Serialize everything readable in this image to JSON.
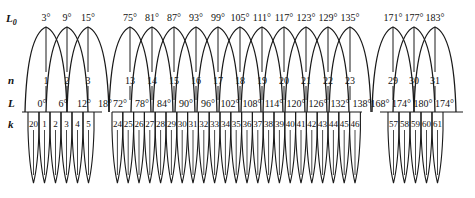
{
  "diagram": {
    "row_labels": {
      "L0": "L",
      "L0_sub": "0",
      "n": "n",
      "L": "L",
      "k": "k"
    },
    "colors": {
      "stroke": "#1a1a1a",
      "background": "#ffffff"
    },
    "groups": [
      {
        "n": [
          "1",
          "2",
          "3"
        ],
        "L0": [
          "3°",
          "9°",
          "15°"
        ],
        "L": [
          "0°",
          "6°",
          "12°",
          "18°"
        ],
        "k": [
          "20",
          "1",
          "2",
          "3",
          "4",
          "5"
        ]
      },
      {
        "n": [
          "13",
          "14",
          "15",
          "16",
          "17",
          "18",
          "19",
          "20",
          "21",
          "22",
          "23"
        ],
        "L0": [
          "75°",
          "81°",
          "87°",
          "93°",
          "99°",
          "105°",
          "111°",
          "117°",
          "123°",
          "129°",
          "135°"
        ],
        "L": [
          "72°",
          "78°",
          "84°",
          "90°",
          "96°",
          "102°",
          "108°",
          "114°",
          "120°",
          "126°",
          "132°",
          "138°"
        ],
        "k": [
          "24",
          "25",
          "26",
          "27",
          "28",
          "29",
          "30",
          "31",
          "32",
          "33",
          "34",
          "35",
          "36",
          "37",
          "38",
          "39",
          "40",
          "41",
          "42",
          "43",
          "44",
          "45",
          "46"
        ]
      },
      {
        "n": [
          "29",
          "30",
          "31"
        ],
        "L0": [
          "171°",
          "177°",
          "183°"
        ],
        "L": [
          "168°",
          "174°",
          "180°",
          "174°"
        ],
        "k": [
          "57",
          "58",
          "59",
          "60",
          "61"
        ]
      }
    ]
  }
}
